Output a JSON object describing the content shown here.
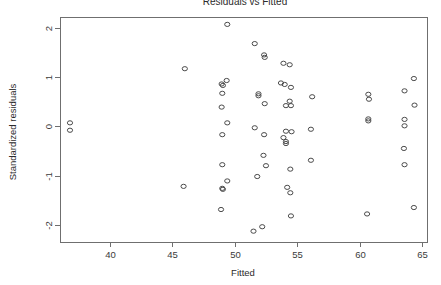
{
  "chart_data": {
    "type": "scatter",
    "title": "Residuals vs Fitted",
    "xlabel": "Fitted",
    "ylabel": "Standardized residuals",
    "xlim": [
      36.0,
      65.4
    ],
    "ylim": [
      -2.35,
      2.22
    ],
    "xticks": [
      40,
      45,
      50,
      55,
      60,
      65
    ],
    "xtick_labels": [
      "40",
      "45",
      "50",
      "55",
      "60",
      "65"
    ],
    "yticks": [
      2,
      1,
      0,
      -1,
      -2
    ],
    "ytick_labels": [
      "2",
      "1",
      "0",
      "-1",
      "-2"
    ],
    "grid": false,
    "legend": false,
    "marker": "open-circle",
    "marker_color": "#4a4a4a",
    "points": [
      {
        "x": 36.8,
        "y": 0.07
      },
      {
        "x": 36.8,
        "y": -0.08
      },
      {
        "x": 46.0,
        "y": 1.17
      },
      {
        "x": 45.9,
        "y": -1.22
      },
      {
        "x": 48.95,
        "y": 0.86
      },
      {
        "x": 49.05,
        "y": 0.83
      },
      {
        "x": 49.35,
        "y": 0.93
      },
      {
        "x": 49.0,
        "y": 0.67
      },
      {
        "x": 48.95,
        "y": 0.39
      },
      {
        "x": 49.4,
        "y": 0.07
      },
      {
        "x": 49.0,
        "y": -0.17
      },
      {
        "x": 49.0,
        "y": -0.78
      },
      {
        "x": 49.0,
        "y": -1.26
      },
      {
        "x": 49.05,
        "y": -1.28
      },
      {
        "x": 49.4,
        "y": -1.11
      },
      {
        "x": 48.9,
        "y": -1.69
      },
      {
        "x": 49.4,
        "y": 2.07
      },
      {
        "x": 51.6,
        "y": 1.68
      },
      {
        "x": 52.35,
        "y": 1.45
      },
      {
        "x": 52.4,
        "y": 1.4
      },
      {
        "x": 51.9,
        "y": 0.66
      },
      {
        "x": 51.9,
        "y": 0.62
      },
      {
        "x": 52.4,
        "y": 0.46
      },
      {
        "x": 51.6,
        "y": -0.03
      },
      {
        "x": 52.35,
        "y": -0.17
      },
      {
        "x": 52.3,
        "y": -0.59
      },
      {
        "x": 52.5,
        "y": -0.8
      },
      {
        "x": 51.8,
        "y": -1.02
      },
      {
        "x": 51.5,
        "y": -2.13
      },
      {
        "x": 52.2,
        "y": -2.04
      },
      {
        "x": 53.9,
        "y": 1.28
      },
      {
        "x": 54.4,
        "y": 1.25
      },
      {
        "x": 53.7,
        "y": 0.88
      },
      {
        "x": 54.0,
        "y": 0.85
      },
      {
        "x": 54.5,
        "y": 0.79
      },
      {
        "x": 54.4,
        "y": 0.51
      },
      {
        "x": 54.1,
        "y": 0.42
      },
      {
        "x": 54.5,
        "y": 0.42
      },
      {
        "x": 54.1,
        "y": -0.1
      },
      {
        "x": 54.55,
        "y": -0.11
      },
      {
        "x": 53.9,
        "y": -0.23
      },
      {
        "x": 54.1,
        "y": -0.31
      },
      {
        "x": 54.1,
        "y": -0.35
      },
      {
        "x": 54.2,
        "y": -1.24
      },
      {
        "x": 54.45,
        "y": -0.87
      },
      {
        "x": 54.45,
        "y": -1.35
      },
      {
        "x": 54.5,
        "y": -1.82
      },
      {
        "x": 56.2,
        "y": 0.6
      },
      {
        "x": 56.1,
        "y": -0.06
      },
      {
        "x": 56.1,
        "y": -0.69
      },
      {
        "x": 60.7,
        "y": 0.65
      },
      {
        "x": 60.75,
        "y": 0.55
      },
      {
        "x": 60.7,
        "y": 0.15
      },
      {
        "x": 60.7,
        "y": 0.11
      },
      {
        "x": 60.6,
        "y": -1.78
      },
      {
        "x": 64.35,
        "y": 0.97
      },
      {
        "x": 63.6,
        "y": 0.72
      },
      {
        "x": 64.4,
        "y": 0.43
      },
      {
        "x": 63.6,
        "y": 0.14
      },
      {
        "x": 63.6,
        "y": 0.01
      },
      {
        "x": 63.55,
        "y": -0.45
      },
      {
        "x": 63.6,
        "y": -0.78
      },
      {
        "x": 64.35,
        "y": -1.65
      }
    ]
  },
  "axes": {
    "x_title": "Fitted",
    "y_title": "Standardized residuals"
  }
}
